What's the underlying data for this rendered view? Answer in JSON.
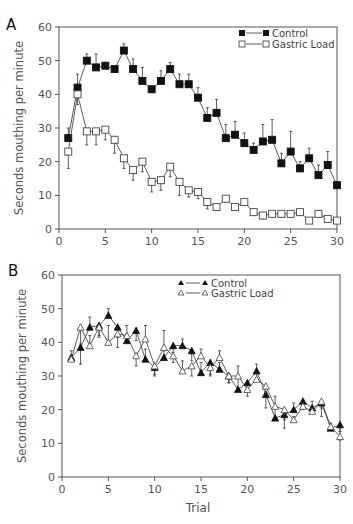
{
  "chart_data": [
    {
      "panel": "A",
      "type": "line",
      "title": "",
      "xlabel": "",
      "ylabel": "Seconds mouthing per minute",
      "xlim": [
        0,
        30
      ],
      "ylim": [
        0,
        60
      ],
      "xticks": [
        0,
        5,
        10,
        15,
        20,
        25,
        30
      ],
      "yticks": [
        0,
        10,
        20,
        30,
        40,
        50,
        60
      ],
      "legend_position": "upper right",
      "grid": false,
      "x": [
        1,
        2,
        3,
        4,
        5,
        6,
        7,
        8,
        9,
        10,
        11,
        12,
        13,
        14,
        15,
        16,
        17,
        18,
        19,
        20,
        21,
        22,
        23,
        24,
        25,
        26,
        27,
        28,
        29,
        30
      ],
      "series": [
        {
          "name": "Control",
          "marker": "filled-square",
          "values": [
            27,
            42,
            50,
            48,
            48.5,
            47.5,
            53,
            47.5,
            44,
            41.5,
            44,
            47.5,
            43,
            43,
            39,
            33,
            34.5,
            27,
            28,
            25.5,
            23.5,
            26,
            26.5,
            19.5,
            23,
            18,
            21,
            16,
            19,
            13
          ],
          "error": [
            3,
            4,
            2,
            4,
            1,
            1,
            2,
            3,
            4,
            1,
            3,
            2,
            3,
            3,
            3,
            3,
            4,
            4,
            4,
            3,
            2,
            5,
            6,
            3,
            6,
            2,
            3,
            3,
            4,
            1
          ]
        },
        {
          "name": "Gastric Load",
          "marker": "open-square",
          "values": [
            23,
            40,
            29,
            29,
            29.5,
            26.5,
            21,
            17.5,
            20,
            14,
            14.5,
            18.5,
            14,
            11.5,
            11,
            8,
            6.5,
            9,
            6.5,
            8,
            5,
            4,
            4.5,
            4.5,
            4.5,
            5,
            2.5,
            4.5,
            3,
            2.5
          ],
          "error": [
            5,
            3,
            4,
            4,
            3,
            4,
            3,
            3,
            3,
            3,
            3,
            3,
            4,
            2,
            2,
            2,
            1,
            1,
            1,
            1,
            1,
            1,
            1,
            1,
            1,
            1,
            0,
            1,
            1,
            0
          ]
        }
      ]
    },
    {
      "panel": "B",
      "type": "line",
      "title": "",
      "xlabel": "Trial",
      "ylabel": "Seconds mouthing per minute",
      "xlim": [
        0,
        30
      ],
      "ylim": [
        0,
        60
      ],
      "xticks": [
        0,
        5,
        10,
        15,
        20,
        25,
        30
      ],
      "yticks": [
        0,
        10,
        20,
        30,
        40,
        50,
        60
      ],
      "legend_position": "upper right",
      "grid": false,
      "x": [
        1,
        2,
        3,
        4,
        5,
        6,
        7,
        8,
        9,
        10,
        11,
        12,
        13,
        14,
        15,
        16,
        17,
        18,
        19,
        20,
        21,
        22,
        23,
        24,
        25,
        26,
        27,
        28,
        29,
        30
      ],
      "series": [
        {
          "name": "Control",
          "marker": "filled-triangle",
          "values": [
            35.5,
            38.5,
            44.5,
            45,
            48,
            44.5,
            40.5,
            43.5,
            35,
            32.5,
            35.5,
            39,
            39,
            37.5,
            31,
            34,
            32,
            30,
            26,
            28,
            31.5,
            24.5,
            17.5,
            18.5,
            20,
            22.5,
            20.5,
            22,
            14.5,
            15.5
          ],
          "error": [
            2,
            5,
            3,
            3,
            2,
            3,
            2,
            3,
            3,
            2,
            2,
            2,
            2,
            3,
            3,
            4,
            2,
            2,
            4,
            2,
            2,
            4,
            3,
            4,
            2,
            2,
            2,
            4,
            1,
            2
          ]
        },
        {
          "name": "Gastric Load",
          "marker": "open-triangle",
          "values": [
            35,
            44.5,
            39,
            44.5,
            40,
            42.5,
            42,
            36,
            41,
            33,
            38.5,
            36,
            31.5,
            33,
            36,
            32.5,
            35.5,
            30,
            30,
            26,
            29,
            27,
            21,
            20,
            17,
            21,
            19.5,
            22.5,
            15,
            12
          ],
          "error": [
            1,
            5,
            3,
            3,
            5,
            4,
            3,
            3,
            4,
            3,
            5,
            2,
            3,
            3,
            2,
            2,
            2,
            2,
            3,
            2,
            2,
            2,
            3,
            3,
            1,
            1,
            1,
            2,
            1,
            1
          ]
        }
      ]
    }
  ],
  "panels": {
    "A": {
      "label": "A",
      "legend": {
        "control": "Control",
        "gastric": "Gastric Load"
      }
    },
    "B": {
      "label": "B",
      "legend": {
        "control": "Control",
        "gastric": "Gastric Load"
      }
    }
  },
  "axes": {
    "ylabel": "Seconds mouthing per minute",
    "xlabel": "Trial",
    "yticks": [
      "0",
      "10",
      "20",
      "30",
      "40",
      "50",
      "60"
    ],
    "xticks": [
      "0",
      "5",
      "10",
      "15",
      "20",
      "25",
      "30"
    ]
  }
}
